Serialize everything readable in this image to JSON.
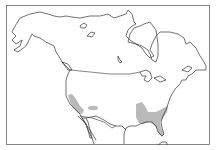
{
  "map": {
    "title": "North America range map",
    "region": "North America",
    "range_color": "#b9b9b9",
    "line_color": "#333333",
    "range_areas": [
      {
        "name": "California coast / Southwest"
      },
      {
        "name": "Arizona interior patch"
      },
      {
        "name": "Southeastern United States and Florida"
      }
    ]
  }
}
